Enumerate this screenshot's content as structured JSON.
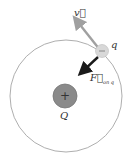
{
  "diagram": {
    "central_charge": {
      "label": "Q",
      "sign": "+",
      "color": "#8a8a8a"
    },
    "orbiting_charge": {
      "label": "q",
      "sign": "−",
      "color": "#d8d8d8"
    },
    "velocity_vector": {
      "label": "v⃗",
      "color": "#a0a0a0"
    },
    "force_vector": {
      "label": "F⃗",
      "subscript": "on q",
      "color": "#1a1a1a"
    },
    "orbit_color": "#999999"
  }
}
